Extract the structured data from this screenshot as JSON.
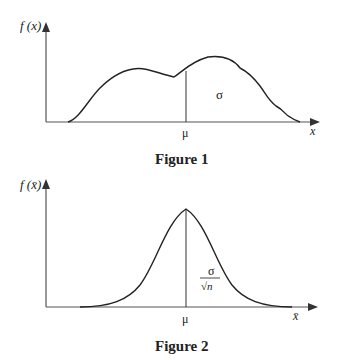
{
  "figures": [
    {
      "caption": "Figure 1",
      "y_axis_label": "f (x)",
      "x_axis_label": "x",
      "mean_label": "μ",
      "spread_label": "σ",
      "curve_description": "bimodal, irregular population distribution"
    },
    {
      "caption": "Figure 2",
      "y_axis_label": "f (x̄)",
      "x_axis_label": "x̄",
      "mean_label": "μ",
      "spread_label_numerator": "σ",
      "spread_label_denominator": "√n",
      "curve_description": "normal sampling distribution of the mean"
    }
  ],
  "colors": {
    "ink": "#222222",
    "axis": "#555555",
    "background": "#ffffff"
  }
}
